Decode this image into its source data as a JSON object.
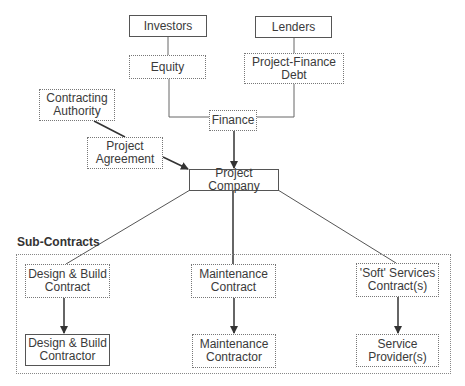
{
  "diagram": {
    "title_section": "Sub-Contracts",
    "nodes": {
      "investors": {
        "label": "Investors",
        "style": "solid"
      },
      "lenders": {
        "label": "Lenders",
        "style": "solid"
      },
      "equity": {
        "label": "Equity",
        "style": "dotted"
      },
      "pf_debt": {
        "label": "Project-Finance\nDebt",
        "style": "dotted"
      },
      "contracting_authority": {
        "label": "Contracting\nAuthority",
        "style": "dotted"
      },
      "project_agreement": {
        "label": "Project\nAgreement",
        "style": "dotted"
      },
      "finance": {
        "label": "Finance",
        "style": "dotted"
      },
      "project_company": {
        "label": "Project Company",
        "style": "solid"
      },
      "db_contract": {
        "label": "Design & Build\nContract",
        "style": "dotted"
      },
      "maint_contract": {
        "label": "Maintenance\nContract",
        "style": "dotted"
      },
      "soft_contract": {
        "label": "'Soft' Services\nContract(s)",
        "style": "dotted"
      },
      "db_contractor": {
        "label": "Design & Build\nContractor",
        "style": "solid"
      },
      "maint_contractor": {
        "label": "Maintenance\nContractor",
        "style": "dotted"
      },
      "service_provider": {
        "label": "Service\nProvider(s)",
        "style": "dotted"
      }
    },
    "edges": [
      {
        "from": "investors",
        "to": "equity",
        "arrow": false
      },
      {
        "from": "lenders",
        "to": "pf_debt",
        "arrow": false
      },
      {
        "from": "equity",
        "to": "finance",
        "arrow": false
      },
      {
        "from": "pf_debt",
        "to": "finance",
        "arrow": false
      },
      {
        "from": "finance",
        "to": "project_company",
        "arrow": true
      },
      {
        "from": "contracting_authority",
        "to": "project_agreement",
        "arrow": false
      },
      {
        "from": "project_agreement",
        "to": "project_company",
        "arrow": true
      },
      {
        "from": "project_company",
        "to": "db_contract",
        "arrow": false
      },
      {
        "from": "project_company",
        "to": "maint_contract",
        "arrow": false
      },
      {
        "from": "project_company",
        "to": "soft_contract",
        "arrow": false
      },
      {
        "from": "db_contract",
        "to": "db_contractor",
        "arrow": true
      },
      {
        "from": "maint_contract",
        "to": "maint_contractor",
        "arrow": true
      },
      {
        "from": "soft_contract",
        "to": "service_provider",
        "arrow": true
      }
    ]
  }
}
